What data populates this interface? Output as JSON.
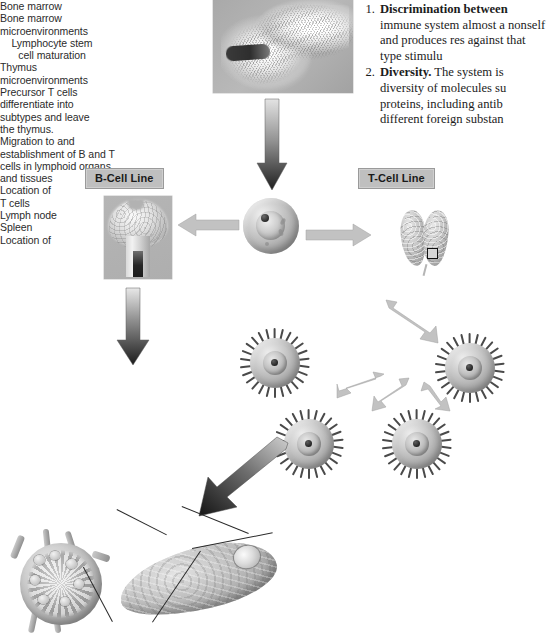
{
  "figure": {
    "labels": {
      "bone_marrow": "Bone marrow",
      "bone_marrow_microenvironments": "Bone marrow\nmicroenvironments",
      "b_cell_line": "B-Cell Line",
      "t_cell_line": "T-Cell Line",
      "thymus_microenvironments": "Thymus\nmicroenvironments",
      "lymphocyte_stem_cell": "Lymphocyte stem\ncell maturation",
      "precursor_t_cells": "Precursor T cells\ndifferentiate into\nsubtypes and leave\nthe thymus.",
      "migration": "Migration to and\nestablishment of B and T\ncells in lymphoid organs\nand tissues",
      "location_of_t_cells": "Location of\nT cells",
      "lymph_node": "Lymph node",
      "spleen": "Spleen",
      "location_of": "Location of"
    },
    "colors": {
      "label_box_fill": "#bfbfbf",
      "label_box_border": "#9a9a9a",
      "arrow_light": "#c9c9c9",
      "arrow_dark": "#2d2d2d",
      "text": "#2b2b2b"
    }
  },
  "body_text": {
    "items": [
      {
        "number": "1.",
        "lead": "Discrimination between",
        "rest": "immune system almost a nonself and produces res against that type stimulu"
      },
      {
        "number": "2.",
        "lead": "Diversity.",
        "rest": "The system is diversity of molecules su proteins, including antib different foreign substan"
      }
    ]
  }
}
